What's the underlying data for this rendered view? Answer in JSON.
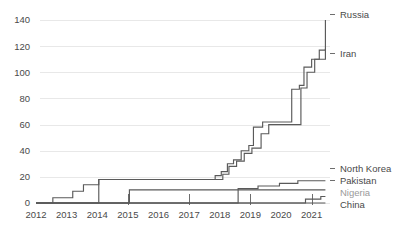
{
  "chart_data": {
    "type": "line",
    "line_style": "step-post",
    "title": "",
    "subtitle": "",
    "xlabel": "",
    "ylabel": "",
    "grid": true,
    "legend_position": "right-inline-labels",
    "xlim": [
      2012,
      2021.6
    ],
    "ylim": [
      0,
      140
    ],
    "xticks": [
      2012,
      2013,
      2014,
      2015,
      2016,
      2017,
      2018,
      2019,
      2020,
      2021
    ],
    "xtick_labels": [
      "2012",
      "2013",
      "2014",
      "2015",
      "2016",
      "2017",
      "2018",
      "2019",
      "2020",
      "2021"
    ],
    "xtick_marks": [
      2015,
      2017,
      2019,
      2021
    ],
    "yticks": [
      0,
      20,
      40,
      60,
      80,
      100,
      120,
      140
    ],
    "ytick_labels": [
      "0",
      "20",
      "40",
      "60",
      "80",
      "100",
      "120",
      "140"
    ],
    "series": [
      {
        "name": "Russia",
        "label": "Russia",
        "muted": false,
        "x": [
          2012.0,
          2012.3,
          2012.55,
          2012.95,
          2013.2,
          2013.55,
          2014.05,
          2016.45,
          2017.85,
          2018.05,
          2018.25,
          2018.45,
          2018.7,
          2018.95,
          2019.1,
          2019.4,
          2019.95,
          2020.35,
          2020.6,
          2020.75,
          2021.0,
          2021.25,
          2021.45
        ],
        "y": [
          0,
          0,
          4,
          4,
          9,
          14,
          18,
          18,
          21,
          24,
          30,
          33,
          40,
          44,
          58,
          62,
          62,
          87,
          90,
          104,
          110,
          117,
          140
        ]
      },
      {
        "name": "Iran",
        "label": "Iran",
        "muted": false,
        "x": [
          2012.0,
          2014.05,
          2017.9,
          2018.1,
          2018.3,
          2018.55,
          2018.8,
          2019.05,
          2019.35,
          2019.6,
          2020.3,
          2020.65,
          2020.85,
          2021.1,
          2021.45
        ],
        "y": [
          0,
          18,
          18,
          22,
          28,
          32,
          38,
          42,
          53,
          60,
          60,
          88,
          100,
          110,
          118
        ]
      },
      {
        "name": "North Korea",
        "label": "North Korea",
        "muted": false,
        "x": [
          2012.0,
          2015.05,
          2018.6,
          2019.25,
          2019.95,
          2020.55,
          2021.45
        ],
        "y": [
          0,
          0,
          11,
          13,
          15,
          17,
          17
        ]
      },
      {
        "name": "Pakistan",
        "label": "Pakistan",
        "muted": false,
        "x": [
          2012.0,
          2015.05,
          2017.95,
          2021.45
        ],
        "y": [
          0,
          10,
          10,
          10
        ]
      },
      {
        "name": "Nigeria",
        "label": "Nigeria",
        "muted": true,
        "x": [
          2012.0,
          2020.35,
          2020.8,
          2021.3,
          2021.45
        ],
        "y": [
          0,
          0,
          3,
          5,
          5
        ]
      },
      {
        "name": "China",
        "label": "China",
        "muted": false,
        "x": [
          2012.0,
          2021.45
        ],
        "y": [
          0,
          0
        ]
      }
    ],
    "series_labels": [
      {
        "text": "Russia",
        "value": 140,
        "muted": false
      },
      {
        "text": "Iran",
        "value": 118,
        "muted": false
      },
      {
        "text": "North Korea",
        "value": 17,
        "muted": false
      },
      {
        "text": "Pakistan",
        "value": 10,
        "muted": false
      },
      {
        "text": "Nigeria",
        "value": 5,
        "muted": true
      },
      {
        "text": "China",
        "value": 0,
        "muted": false
      }
    ],
    "colors": {
      "line": "#5a5a5a",
      "grid": "#e8e8e8",
      "text": "#4a4a4a",
      "muted_text": "#9a9a9a",
      "background": "#ffffff"
    }
  }
}
